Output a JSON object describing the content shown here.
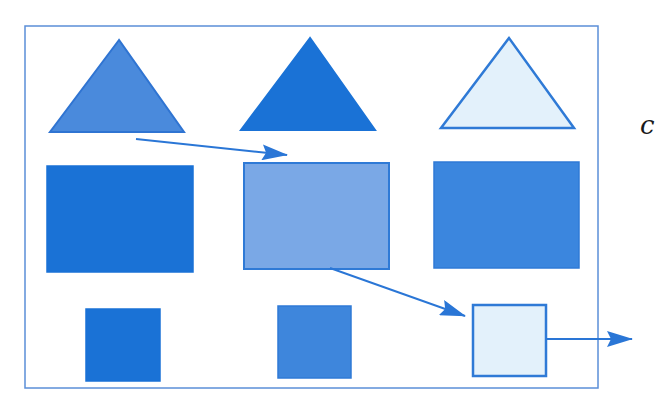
{
  "diagram": {
    "frame": {
      "x": 25,
      "y": 26,
      "width": 573,
      "height": 362,
      "stroke": "#5b8fd8"
    },
    "colors": {
      "medium_blue": "#4a8adc",
      "dark_blue": "#1a72d6",
      "light_blue_fill": "#e3f1fb",
      "light_blue_stroke": "#2f7ad6",
      "faded_blue": "#7aa8e6",
      "rect3_blue": "#3b86de",
      "square2_blue": "#3e86dc",
      "arrow": "#2a76d6"
    },
    "shapes": [
      {
        "id": "triangle-1",
        "type": "triangle",
        "points": "119,40 50,132 184,132",
        "fill": "#4a8adc",
        "stroke": "#2f74d2"
      },
      {
        "id": "triangle-2",
        "type": "triangle",
        "points": "310,38 241,130 375,130",
        "fill": "#1a72d6",
        "stroke": "#1a72d6"
      },
      {
        "id": "triangle-3",
        "type": "triangle",
        "points": "509,38 441,128 574,128",
        "fill": "#e3f1fb",
        "stroke": "#2f7ad6"
      },
      {
        "id": "rectangle-1",
        "type": "rect",
        "x": 47,
        "y": 166,
        "width": 146,
        "height": 106,
        "fill": "#1a72d6",
        "stroke": "#1a72d6"
      },
      {
        "id": "rectangle-2",
        "type": "rect",
        "x": 244,
        "y": 163,
        "width": 145,
        "height": 106,
        "fill": "#7aa8e6",
        "stroke": "#2f7ad6"
      },
      {
        "id": "rectangle-3",
        "type": "rect",
        "x": 434,
        "y": 162,
        "width": 145,
        "height": 106,
        "fill": "#3b86de",
        "stroke": "#2f7ad6"
      },
      {
        "id": "square-1",
        "type": "rect",
        "x": 86,
        "y": 309,
        "width": 74,
        "height": 72,
        "fill": "#1a72d6",
        "stroke": "#1a72d6"
      },
      {
        "id": "square-2",
        "type": "rect",
        "x": 278,
        "y": 306,
        "width": 73,
        "height": 72,
        "fill": "#3e86dc",
        "stroke": "#2f7ad6"
      },
      {
        "id": "square-3",
        "type": "rect",
        "x": 473,
        "y": 305,
        "width": 73,
        "height": 71,
        "fill": "#e3f1fb",
        "stroke": "#2f7ad6"
      }
    ],
    "arrows": [
      {
        "id": "arrow-1",
        "x1": 136,
        "y1": 139,
        "x2": 287,
        "y2": 155
      },
      {
        "id": "arrow-2",
        "x1": 330,
        "y1": 268,
        "x2": 465,
        "y2": 316
      },
      {
        "id": "arrow-3",
        "x1": 546,
        "y1": 339,
        "x2": 632,
        "y2": 339
      }
    ],
    "edge_text": "c"
  }
}
